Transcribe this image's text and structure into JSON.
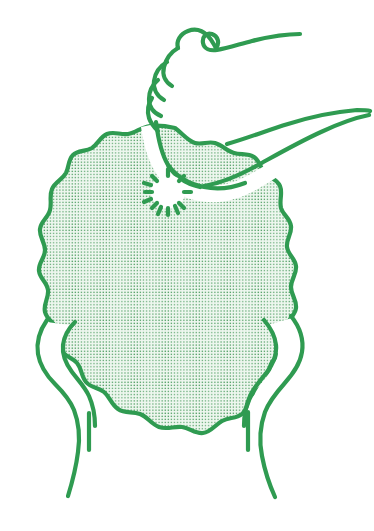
{
  "figure": {
    "title": "Person striking chest with clenched fist",
    "caption": "Line drawing of a human torso, viewed from the front, with one arm raised and the hand closed into a fist held against the upper chest; a small starburst marks the point of impact. The other arm hangs down at the side.",
    "style": "hand-drawn line art with stippled halftone fill",
    "background_color": "#ffffff",
    "ink_color": "#2f9b51",
    "fill_dot_color": "#4f9e63",
    "fill_wash_color": "#eef7ef",
    "stroke_width_px": 4
  },
  "parts": [
    {
      "id": "torso",
      "label": "Torso",
      "description": "Large rounded chest and abdomen shape with a wavy scalloped outline, filled with an even dot stipple pattern",
      "fill": "stipple"
    },
    {
      "id": "neck",
      "label": "Neck",
      "description": "Short neck rising from the top of the torso, left unfilled (white)",
      "fill": "none"
    },
    {
      "id": "raised-forearm",
      "label": "Raised forearm",
      "description": "Forearm angling up and to the right from the shoulder toward the fist, drawn as a white unfilled band",
      "fill": "none"
    },
    {
      "id": "fist",
      "label": "Clenched fist",
      "description": "Hand closed into a fist at the top of the drawing, knuckles and curled fingers indicated by short curved strokes on the left side",
      "fill": "none"
    },
    {
      "id": "impact-starburst",
      "label": "Impact starburst",
      "description": "Radiating short dashes forming a small burst on the chest where the fist makes contact",
      "fill": "none"
    },
    {
      "id": "left-arm",
      "label": "Left arm (viewer left)",
      "description": "Arm hanging down along the left side of the torso, ending below the frame of the body",
      "fill": "none"
    },
    {
      "id": "right-arm",
      "label": "Right arm (viewer right)",
      "description": "Arm hanging down along the right side of the torso, ending below the frame of the body",
      "fill": "none"
    }
  ],
  "annotations": {
    "impact_marker": "starburst",
    "impact_position": {
      "x": 166,
      "y": 190
    },
    "gesture": "fist to chest"
  }
}
